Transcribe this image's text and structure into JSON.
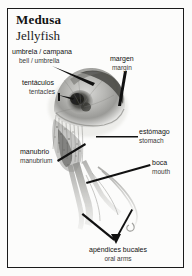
{
  "title": {
    "spanish": "Medusa",
    "english": "Jellyfish"
  },
  "labels": [
    {
      "id": "umbrela",
      "spanish": "umbrela / campana",
      "english": "bell / umbrella"
    },
    {
      "id": "tentaculos",
      "spanish": "tentáculos",
      "english": "tentacles"
    },
    {
      "id": "margen",
      "spanish": "margen",
      "english": "margin"
    },
    {
      "id": "estomago",
      "spanish": "estómago",
      "english": "stomach"
    },
    {
      "id": "boca",
      "spanish": "boca",
      "english": "mouth"
    },
    {
      "id": "manubrio",
      "spanish": "manubrio",
      "english": "manubrium"
    },
    {
      "id": "apendices",
      "spanish": "apéndices bucales",
      "english": "oral arms"
    }
  ],
  "illustration": {
    "name": "jellyfish-photograph",
    "description": "grayscale photograph of a jellyfish"
  },
  "colors": {
    "frame": "#1a1a1a",
    "background": "#fcfcfb",
    "text": "#131313",
    "leader_line": "#101010"
  }
}
